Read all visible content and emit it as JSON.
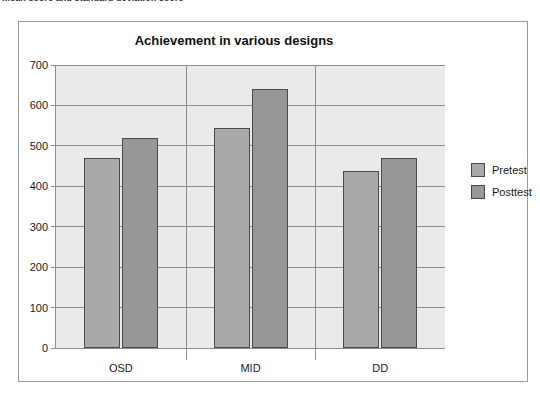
{
  "caption": {
    "text": "mean score and standard deviation score"
  },
  "chart_data": {
    "type": "bar",
    "title": "Achievement in various designs",
    "xlabel": "",
    "ylabel": "",
    "categories": [
      "OSD",
      "MID",
      "DD"
    ],
    "series": [
      {
        "name": "Pretest",
        "values": [
          470,
          544,
          438
        ],
        "color": "#a9a9a9"
      },
      {
        "name": "Posttest",
        "values": [
          520,
          640,
          470
        ],
        "color": "#979797"
      }
    ],
    "ylim": [
      0,
      700
    ],
    "yticks": [
      0,
      100,
      200,
      300,
      400,
      500,
      600,
      700
    ],
    "ytick_labels": [
      "0",
      "100",
      "200",
      "300",
      "400",
      "500",
      "600",
      "700"
    ],
    "grid": true,
    "legend_position": "right",
    "plot_background": "#eaeaea",
    "frame_color": "#9a9a9a",
    "axis_color": "#8d8d8d",
    "bar_border_color": "#4a4a4a"
  }
}
